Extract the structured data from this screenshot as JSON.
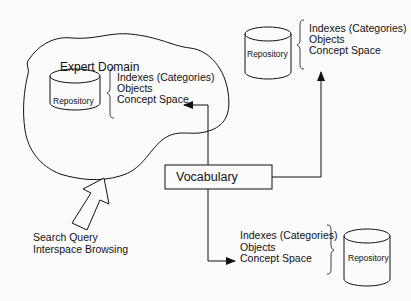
{
  "diagram": {
    "expert_domain": {
      "title": "Expert Domain",
      "repository_label": "Repository",
      "contents": [
        "Indexes (Categories)",
        "Objects",
        "Concept Space"
      ]
    },
    "top_right_node": {
      "repository_label": "Repository",
      "contents": [
        "Indexes (Categories)",
        "Objects",
        "Concept Space"
      ]
    },
    "bottom_right_node": {
      "repository_label": "Repository",
      "contents": [
        "Indexes (Categories)",
        "Objects",
        "Concept Space"
      ]
    },
    "vocabulary": {
      "label": "Vocabulary"
    },
    "user_input": {
      "lines": [
        "Search Query",
        "Interspace Browsing"
      ]
    },
    "colors": {
      "stroke": "#111111",
      "background": "#fbfbfb"
    }
  }
}
